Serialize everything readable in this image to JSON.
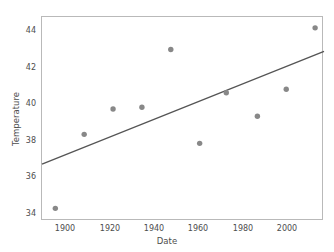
{
  "chart_data": {
    "type": "scatter",
    "title": "",
    "xlabel": "Date",
    "ylabel": "Temperature",
    "xlim": [
      1889,
      2016
    ],
    "ylim": [
      33.5,
      44.8
    ],
    "xticks": [
      1900,
      1920,
      1940,
      1960,
      1980,
      2000
    ],
    "yticks": [
      34,
      36,
      38,
      40,
      42,
      44
    ],
    "xtick_labels": [
      "1900",
      "1920",
      "1940",
      "1960",
      "1980",
      "2000"
    ],
    "ytick_labels": [
      "34",
      "36",
      "38",
      "40",
      "42",
      "44"
    ],
    "grid": false,
    "legend": false,
    "marker_color": "#888888",
    "line_color": "#555555",
    "axis_color": "#b9b9b9",
    "text_color": "#4d4d4d",
    "points": [
      {
        "x": 1895,
        "y": 34.2
      },
      {
        "x": 1908,
        "y": 38.3
      },
      {
        "x": 1921,
        "y": 39.7
      },
      {
        "x": 1934,
        "y": 39.8
      },
      {
        "x": 1947,
        "y": 43.0
      },
      {
        "x": 1960,
        "y": 37.8
      },
      {
        "x": 1972,
        "y": 40.6
      },
      {
        "x": 1986,
        "y": 39.3
      },
      {
        "x": 1999,
        "y": 40.8
      },
      {
        "x": 2012,
        "y": 44.2
      }
    ],
    "series": [
      {
        "name": "observations",
        "x": [
          1895,
          1908,
          1921,
          1934,
          1947,
          1960,
          1972,
          1986,
          1999,
          2012
        ],
        "values": [
          34.2,
          38.3,
          39.7,
          39.8,
          43.0,
          37.8,
          40.6,
          39.3,
          40.8,
          44.2
        ]
      }
    ],
    "trend_line": {
      "name": "linear-fit",
      "x0": 1889,
      "y0": 36.65,
      "x1": 2016,
      "y1": 42.9
    }
  }
}
